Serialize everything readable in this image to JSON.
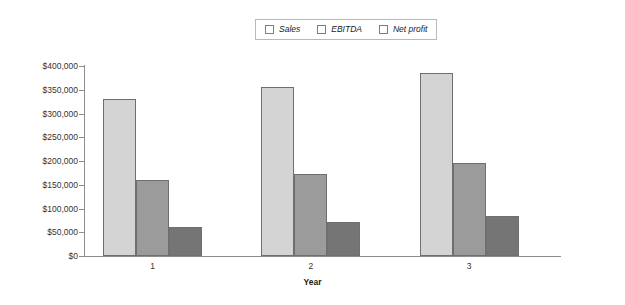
{
  "chart_data": {
    "type": "bar",
    "title": "",
    "subtitle": "",
    "xlabel": "Year",
    "ylabel": "",
    "categories": [
      "1",
      "2",
      "3"
    ],
    "series": [
      {
        "name": "Sales",
        "values": [
          330000,
          355000,
          385000
        ],
        "color": "#d4d4d4"
      },
      {
        "name": "EBITDA",
        "values": [
          160000,
          172000,
          195000
        ],
        "color": "#9b9b9b"
      },
      {
        "name": "Net profit",
        "values": [
          62000,
          71000,
          84000
        ],
        "color": "#757575"
      }
    ],
    "ylim": [
      0,
      400000
    ],
    "ytick_step": 50000,
    "ytick_labels": [
      "$400,000",
      "$350,000",
      "$300,000",
      "$250,000",
      "$200,000",
      "$150,000",
      "$100,000",
      "$50,000",
      "$0"
    ],
    "ytick_values": [
      400000,
      350000,
      300000,
      250000,
      200000,
      150000,
      100000,
      50000,
      0
    ],
    "grid": false,
    "legend_position": "top-center",
    "legend_border": true,
    "legend_italic": true,
    "bar_grouping": "clustered",
    "axis_color": "#8d8d8d",
    "bar_border_color": "#6f6f6f",
    "background": "#ffffff"
  },
  "legend": {
    "entries": [
      {
        "label": "Sales",
        "swatch_icon": "legend-swatch-icon"
      },
      {
        "label": "EBITDA",
        "swatch_icon": "legend-swatch-icon"
      },
      {
        "label": "Net profit",
        "swatch_icon": "legend-swatch-icon"
      }
    ]
  },
  "axes": {
    "x_title": "Year",
    "x_categories": [
      "1",
      "2",
      "3"
    ],
    "y_labels": [
      "$400,000",
      "$350,000",
      "$300,000",
      "$250,000",
      "$200,000",
      "$150,000",
      "$100,000",
      "$50,000",
      "$0"
    ]
  }
}
